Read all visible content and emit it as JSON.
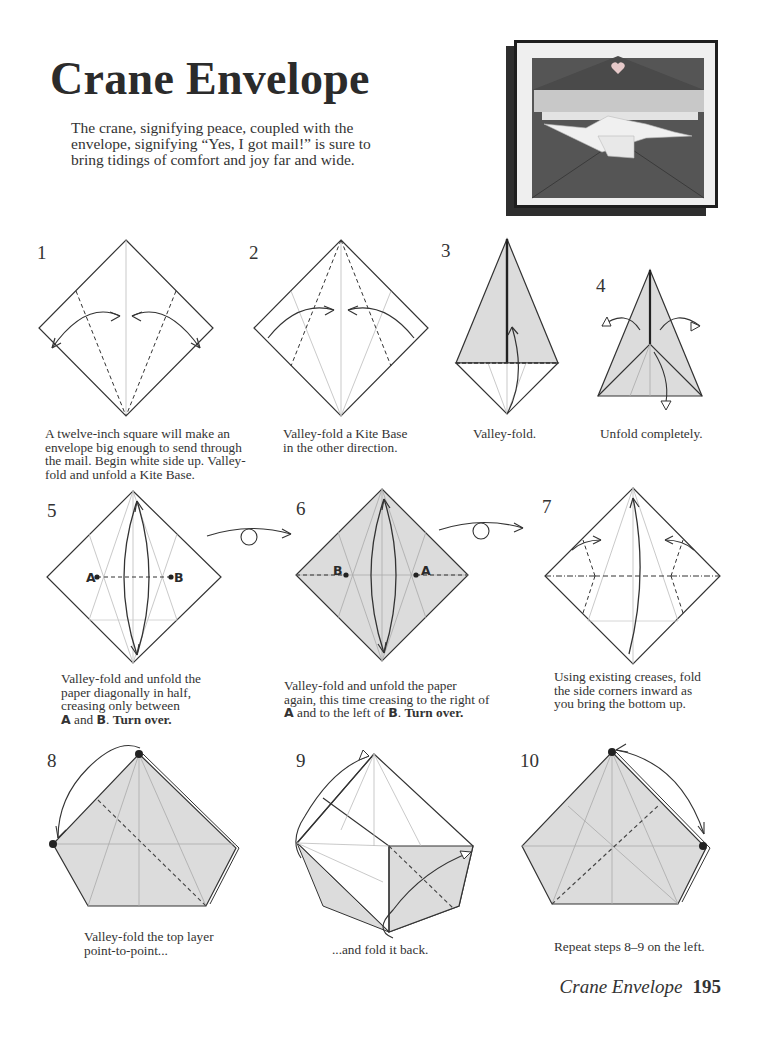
{
  "header": {
    "title": "Crane Envelope",
    "intro": "The crane, signifying peace, coupled with the envelope, signifying “Yes, I got mail!” is sure to bring tidings of comfort and joy far and wide."
  },
  "photo": {
    "description": "photo of dark envelope with folded white crane and heart on flap"
  },
  "steps": [
    {
      "number": "1",
      "caption": "A twelve-inch square will make an envelope big enough to send through the mail.  Begin white side up. Valley-fold and unfold a Kite Base."
    },
    {
      "number": "2",
      "caption": "Valley-fold a Kite Base in the other direction."
    },
    {
      "number": "3",
      "caption": "Valley-fold."
    },
    {
      "number": "4",
      "caption": "Unfold completely."
    },
    {
      "number": "5",
      "caption_lines": [
        "Valley-fold and unfold the",
        "paper diagonally in half,",
        "creasing only between"
      ],
      "caption_a": "A",
      "caption_and": " and ",
      "caption_b": "B",
      "caption_end": ".  ",
      "caption_bold": "Turn over.",
      "label_a": "A",
      "label_b": "B"
    },
    {
      "number": "6",
      "caption_lines": [
        "Valley-fold and unfold the paper",
        "again, this time creasing to the right of"
      ],
      "caption_a": "A",
      "caption_mid": " and to the left of ",
      "caption_b": "B",
      "caption_end": ".  ",
      "caption_bold": "Turn over.",
      "label_a": "A",
      "label_b": "B"
    },
    {
      "number": "7",
      "caption": "Using existing creases, fold the side corners inward as you bring the bottom up."
    },
    {
      "number": "8",
      "caption": "Valley-fold the top layer point-to-point..."
    },
    {
      "number": "9",
      "caption": "...and fold it back."
    },
    {
      "number": "10",
      "caption": "Repeat steps 8–9 on the left."
    }
  ],
  "footer": {
    "title": "Crane Envelope",
    "page": "195"
  },
  "colors": {
    "paper_shade": "#dcdcdc",
    "line": "#333333",
    "crease": "#bbbbbb",
    "envelope": "#555555"
  }
}
